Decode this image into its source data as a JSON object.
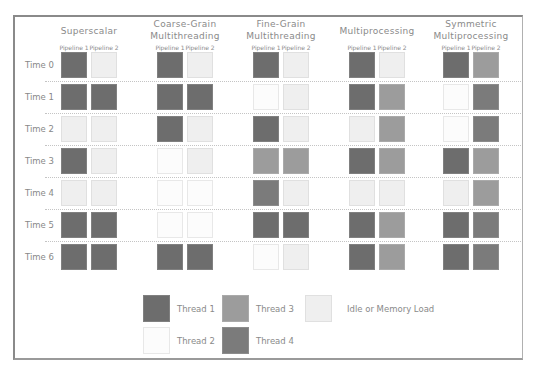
{
  "columns": [
    {
      "title_lines": [
        "Superscalar"
      ],
      "pipelines": [
        "Pipeline 1",
        "Pipeline 2"
      ],
      "cells": [
        [
          "t1",
          "idle"
        ],
        [
          "t1",
          "t1"
        ],
        [
          "idle",
          "idle"
        ],
        [
          "t1",
          "idle"
        ],
        [
          "idle",
          "idle"
        ],
        [
          "t1",
          "t1"
        ],
        [
          "t1",
          "t1"
        ]
      ]
    },
    {
      "title_lines": [
        "Coarse-Grain",
        "Multithreading"
      ],
      "pipelines": [
        "Pipeline 1",
        "Pipeline 2"
      ],
      "cells": [
        [
          "t1",
          "idle"
        ],
        [
          "t1",
          "t1"
        ],
        [
          "t1",
          "idle"
        ],
        [
          "t2",
          "idle"
        ],
        [
          "t2",
          "t2"
        ],
        [
          "t2",
          "t2"
        ],
        [
          "t1",
          "t1"
        ]
      ]
    },
    {
      "title_lines": [
        "Fine-Grain",
        "Multithreading"
      ],
      "pipelines": [
        "Pipeline 1",
        "Pipeline 2"
      ],
      "cells": [
        [
          "t1",
          "idle"
        ],
        [
          "t2",
          "idle"
        ],
        [
          "t1",
          "idle"
        ],
        [
          "t3",
          "t3"
        ],
        [
          "t4",
          "idle"
        ],
        [
          "t1",
          "t1"
        ],
        [
          "t2",
          "idle"
        ]
      ]
    },
    {
      "title_lines": [
        "Multiprocessing"
      ],
      "pipelines": [
        "Pipeline 1",
        "Pipeline 2"
      ],
      "cells": [
        [
          "t1",
          "idle"
        ],
        [
          "t1",
          "t3"
        ],
        [
          "idle",
          "t3"
        ],
        [
          "t1",
          "t3"
        ],
        [
          "idle",
          "idle"
        ],
        [
          "t1",
          "t3"
        ],
        [
          "t1",
          "t3"
        ]
      ]
    },
    {
      "title_lines": [
        "Symmetric",
        "Multiprocessing"
      ],
      "pipelines": [
        "Pipeline 1",
        "Pipeline 2"
      ],
      "cells": [
        [
          "t1",
          "t3"
        ],
        [
          "t2",
          "t4"
        ],
        [
          "t2",
          "t4"
        ],
        [
          "t1",
          "t3"
        ],
        [
          "idle",
          "t3"
        ],
        [
          "t1",
          "t4"
        ],
        [
          "t1",
          "t4"
        ]
      ]
    }
  ],
  "rows": [
    "Time 0",
    "Time 1",
    "Time 2",
    "Time 3",
    "Time 4",
    "Time 5",
    "Time 6"
  ],
  "legend": [
    {
      "key": "t1",
      "label": "Thread 1",
      "color": "#6d6d6d"
    },
    {
      "key": "t2",
      "label": "Thread 2",
      "color": "#fcfcfc"
    },
    {
      "key": "t3",
      "label": "Thread 3",
      "color": "#9c9c9c"
    },
    {
      "key": "t4",
      "label": "Thread 4",
      "color": "#7b7b7b"
    },
    {
      "key": "idle",
      "label": "Idle or Memory Load",
      "color": "#efefef"
    }
  ]
}
